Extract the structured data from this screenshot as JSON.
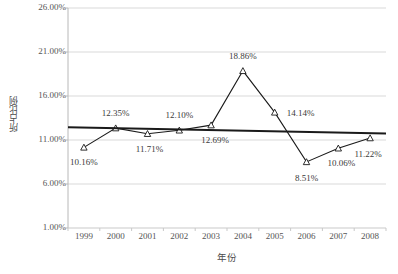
{
  "chart_data": {
    "type": "line",
    "title": "",
    "xlabel": "年份",
    "ylabel": "所占比例",
    "categories": [
      "1999",
      "2000",
      "2001",
      "2002",
      "2003",
      "2004",
      "2005",
      "2006",
      "2007",
      "2008"
    ],
    "series": [
      {
        "name": "所占比例",
        "marker": "open-triangle",
        "color": "#000000",
        "values": [
          10.16,
          12.35,
          11.71,
          12.1,
          12.69,
          18.86,
          14.14,
          8.51,
          10.06,
          11.22
        ],
        "value_labels": [
          "10.16%",
          "12.35%",
          "11.71%",
          "12.10%",
          "12.69%",
          "18.86%",
          "14.14%",
          "8.51%",
          "10.06%",
          "11.22%"
        ]
      },
      {
        "name": "trendline",
        "type": "linear-trendline",
        "color": "#222222",
        "endpoints": [
          12.45,
          11.75
        ]
      }
    ],
    "ytick_labels": [
      "1.00%",
      "6.00%",
      "11.00%",
      "16.00%",
      "21.00%",
      "26.00%"
    ],
    "ytick_values": [
      1,
      6,
      11,
      16,
      21,
      26
    ],
    "ylim": [
      1,
      26
    ],
    "xlim": [
      0,
      10
    ],
    "grid": "horizontal",
    "grid_color": "#d9d9d9",
    "legend": "none",
    "background": "#ffffff"
  },
  "label_offsets": [
    {
      "dx": 0,
      "dy": 16,
      "anchor": "below"
    },
    {
      "dx": 0,
      "dy": -14,
      "anchor": "above"
    },
    {
      "dx": 2,
      "dy": 16,
      "anchor": "below"
    },
    {
      "dx": 0,
      "dy": -14,
      "anchor": "above"
    },
    {
      "dx": 4,
      "dy": 16,
      "anchor": "below"
    },
    {
      "dx": 0,
      "dy": -14,
      "anchor": "above"
    },
    {
      "dx": 26,
      "dy": 2,
      "anchor": "right"
    },
    {
      "dx": 0,
      "dy": 17,
      "anchor": "below"
    },
    {
      "dx": 3,
      "dy": 16,
      "anchor": "below"
    },
    {
      "dx": -2,
      "dy": 17,
      "anchor": "below"
    }
  ]
}
